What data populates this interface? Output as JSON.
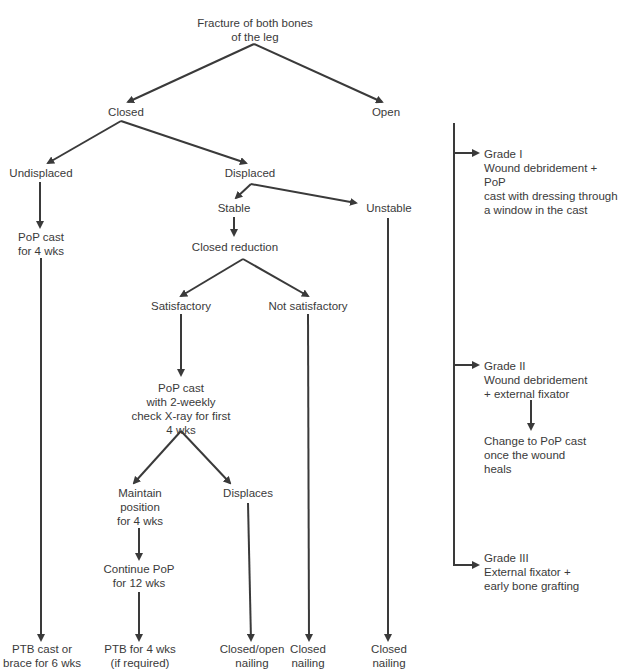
{
  "title": "Fracture of both bones of the leg",
  "colors": {
    "line": "#3a3a3a",
    "text": "#3a3a3a",
    "background": "#ffffff"
  },
  "nodes": {
    "root": "Fracture of both bones\nof the leg",
    "closed": "Closed",
    "open": "Open",
    "undisplaced": "Undisplaced",
    "displaced": "Displaced",
    "stable": "Stable",
    "unstable": "Unstable",
    "pop_cast_4wks": "PoP cast\nfor 4 wks",
    "closed_reduction": "Closed reduction",
    "satisfactory": "Satisfactory",
    "not_satisfactory": "Not satisfactory",
    "pop_cast_checks": "PoP cast\nwith 2-weekly\ncheck X-ray for first\n4 wks",
    "maintain_position": "Maintain\nposition\nfor 4 wks",
    "displaces": "Displaces",
    "continue_pop": "Continue PoP\nfor 12 wks",
    "ptb_cast_brace": "PTB cast or\nbrace for 6 wks",
    "ptb_4wks": "PTB for 4 wks\n(if required)",
    "closed_open_nailing": "Closed/open\nnailing",
    "closed_nailing_1": "Closed\nnailing",
    "closed_nailing_2": "Closed\nnailing",
    "grade1": "Grade I\nWound debridement + PoP\ncast with dressing through\na window in the cast",
    "grade2": "Grade II\nWound debridement\n+ external fixator",
    "grade2_followup": "Change to PoP cast\nonce the wound\nheals",
    "grade3": "Grade III\nExternal fixator +\nearly bone grafting"
  }
}
